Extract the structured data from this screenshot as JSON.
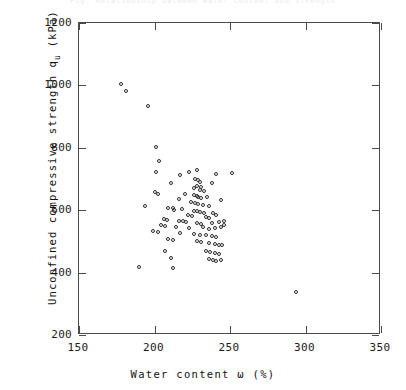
{
  "figure": {
    "top_caption": "Fig.  Relationship  between  water  content  and  strength",
    "background_color": "#ffffff",
    "marker_color": "#2b2b2b",
    "axis_color": "#4a4a4a"
  },
  "axes": {
    "y_title_main": "Unconfined compressive strength q",
    "y_title_sub": "u",
    "y_title_unit": " (kPa)",
    "x_title": "Water content ω (%)",
    "x_ticks": [
      "150",
      "200",
      "250",
      "300",
      "350"
    ],
    "y_ticks": [
      "1200",
      "1000",
      "800",
      "600",
      "400",
      "200"
    ]
  },
  "chart_data": {
    "type": "scatter",
    "title": "",
    "xlabel": "Water content ω (%)",
    "ylabel": "Unconfined compressive strength q_u (kPa)",
    "xlim": [
      150,
      350
    ],
    "ylim": [
      200,
      1200
    ],
    "xticks": [
      150,
      200,
      250,
      300,
      350
    ],
    "yticks": [
      200,
      400,
      600,
      800,
      1000,
      1200
    ],
    "grid": false,
    "legend": null,
    "marker": "open-circle",
    "series": [
      {
        "name": "Soil samples",
        "points": [
          [
            178,
            1005
          ],
          [
            181,
            982
          ],
          [
            196,
            935
          ],
          [
            201,
            804
          ],
          [
            203,
            758
          ],
          [
            201,
            722
          ],
          [
            217,
            712
          ],
          [
            223,
            723
          ],
          [
            228,
            729
          ],
          [
            241,
            717
          ],
          [
            251,
            720
          ],
          [
            227,
            700
          ],
          [
            229,
            697
          ],
          [
            230,
            690
          ],
          [
            211,
            688
          ],
          [
            238,
            686
          ],
          [
            228,
            678
          ],
          [
            231,
            673
          ],
          [
            226,
            670
          ],
          [
            230,
            664
          ],
          [
            233,
            660
          ],
          [
            200,
            659
          ],
          [
            202,
            652
          ],
          [
            220,
            651
          ],
          [
            226,
            648
          ],
          [
            228,
            645
          ],
          [
            229,
            641
          ],
          [
            231,
            638
          ],
          [
            235,
            643
          ],
          [
            216,
            635
          ],
          [
            244,
            632
          ],
          [
            224,
            627
          ],
          [
            227,
            624
          ],
          [
            229,
            620
          ],
          [
            232,
            617
          ],
          [
            236,
            613
          ],
          [
            194,
            612
          ],
          [
            209,
            608
          ],
          [
            212,
            606
          ],
          [
            213,
            600
          ],
          [
            218,
            603
          ],
          [
            226,
            598
          ],
          [
            228,
            596
          ],
          [
            230,
            594
          ],
          [
            233,
            592
          ],
          [
            239,
            590
          ],
          [
            222,
            585
          ],
          [
            225,
            582
          ],
          [
            241,
            586
          ],
          [
            234,
            578
          ],
          [
            236,
            575
          ],
          [
            206,
            572
          ],
          [
            208,
            569
          ],
          [
            216,
            566
          ],
          [
            219,
            564
          ],
          [
            221,
            561
          ],
          [
            228,
            558
          ],
          [
            231,
            556
          ],
          [
            238,
            560
          ],
          [
            243,
            563
          ],
          [
            246,
            566
          ],
          [
            204,
            551
          ],
          [
            207,
            548
          ],
          [
            214,
            545
          ],
          [
            223,
            542
          ],
          [
            232,
            546
          ],
          [
            236,
            540
          ],
          [
            240,
            543
          ],
          [
            244,
            547
          ],
          [
            246,
            551
          ],
          [
            199,
            534
          ],
          [
            202,
            531
          ],
          [
            217,
            528
          ],
          [
            226,
            525
          ],
          [
            230,
            522
          ],
          [
            234,
            519
          ],
          [
            238,
            516
          ],
          [
            241,
            513
          ],
          [
            209,
            508
          ],
          [
            212,
            505
          ],
          [
            228,
            502
          ],
          [
            231,
            499
          ],
          [
            236,
            496
          ],
          [
            240,
            493
          ],
          [
            243,
            490
          ],
          [
            245,
            487
          ],
          [
            207,
            470
          ],
          [
            234,
            468
          ],
          [
            237,
            465
          ],
          [
            240,
            462
          ],
          [
            243,
            459
          ],
          [
            211,
            448
          ],
          [
            236,
            445
          ],
          [
            239,
            442
          ],
          [
            241,
            438
          ],
          [
            244,
            441
          ],
          [
            190,
            418
          ],
          [
            212,
            415
          ],
          [
            294,
            337
          ]
        ]
      }
    ]
  }
}
